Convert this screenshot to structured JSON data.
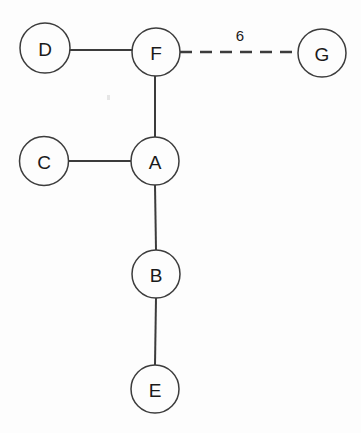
{
  "diagram": {
    "background_color": "#fdfdfd",
    "stroke_color": "#3c3c3c",
    "label_color": "#1a1a1a",
    "node_radius": 24,
    "nodes": [
      {
        "id": "D",
        "label": "D",
        "cx": 45,
        "cy": 48,
        "r": 25
      },
      {
        "id": "F",
        "label": "F",
        "cx": 156,
        "cy": 52,
        "r": 24
      },
      {
        "id": "G",
        "label": "G",
        "cx": 322,
        "cy": 53,
        "r": 24
      },
      {
        "id": "C",
        "label": "C",
        "cx": 44,
        "cy": 161,
        "r": 24.5
      },
      {
        "id": "A",
        "label": "A",
        "cx": 155,
        "cy": 161,
        "r": 24
      },
      {
        "id": "B",
        "label": "B",
        "cx": 156,
        "cy": 274,
        "r": 24
      },
      {
        "id": "E",
        "label": "E",
        "cx": 155,
        "cy": 389,
        "r": 24
      }
    ],
    "edges": [
      {
        "id": "D-F",
        "source": "D",
        "target": "F",
        "style": "solid",
        "label": "",
        "x1": 70,
        "y1": 50,
        "x2": 132,
        "y2": 50
      },
      {
        "id": "F-G",
        "source": "F",
        "target": "G",
        "style": "dashed",
        "label": "6",
        "x1": 180,
        "y1": 52,
        "x2": 298,
        "y2": 52,
        "label_x": 240,
        "label_y": 35
      },
      {
        "id": "F-A",
        "source": "F",
        "target": "A",
        "style": "solid",
        "label": "",
        "x1": 155,
        "y1": 76,
        "x2": 155,
        "y2": 137
      },
      {
        "id": "C-A",
        "source": "C",
        "target": "A",
        "style": "solid",
        "label": "",
        "x1": 68,
        "y1": 161,
        "x2": 131,
        "y2": 161
      },
      {
        "id": "A-B",
        "source": "A",
        "target": "B",
        "style": "solid",
        "label": "",
        "x1": 155,
        "y1": 185,
        "x2": 156,
        "y2": 250
      },
      {
        "id": "B-E",
        "source": "B",
        "target": "E",
        "style": "solid",
        "label": "",
        "x1": 156,
        "y1": 298,
        "x2": 155,
        "y2": 365
      }
    ]
  }
}
